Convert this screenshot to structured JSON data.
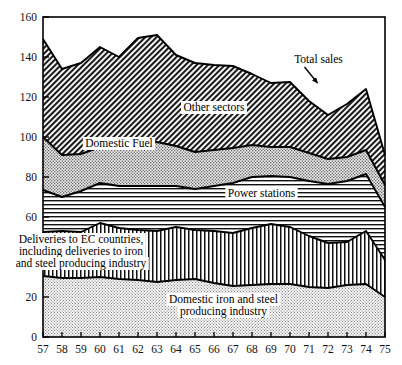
{
  "chart_data": {
    "type": "area",
    "stacked": true,
    "title": "",
    "subtitle": "",
    "xlabel": "",
    "ylabel": "",
    "xlim": [
      57,
      75
    ],
    "ylim": [
      0,
      160
    ],
    "ytick_values": [
      0,
      20,
      40,
      60,
      80,
      100,
      120,
      140,
      160
    ],
    "ytick_labels": [
      "0",
      "20",
      "40",
      "60",
      "80",
      "100",
      "120",
      "140",
      "160"
    ],
    "grid": false,
    "legend_position": "inline-labels",
    "x": [
      57,
      58,
      59,
      60,
      61,
      62,
      63,
      64,
      65,
      66,
      67,
      68,
      69,
      70,
      71,
      72,
      73,
      74,
      75
    ],
    "xtick_labels": [
      "57",
      "58",
      "59",
      "60",
      "61",
      "62",
      "63",
      "64",
      "65",
      "66",
      "67",
      "68",
      "69",
      "70",
      "71",
      "72",
      "73",
      "74",
      "75"
    ],
    "series": [
      {
        "name": "Domestic iron and steel producing industry",
        "pattern": "fine-dots",
        "values": [
          30.5,
          29.5,
          29.5,
          30.0,
          29.0,
          28.5,
          27.5,
          28.5,
          29.0,
          27.0,
          25.5,
          26.0,
          26.5,
          26.5,
          25.0,
          24.5,
          26.0,
          26.5,
          20.0
        ]
      },
      {
        "name": "Deliveries to EC countries, including deliveries to iron and steel producing industry",
        "pattern": "vertical-lines",
        "values": [
          22.0,
          23.5,
          23.0,
          27.0,
          25.5,
          25.0,
          25.5,
          26.5,
          24.5,
          26.0,
          26.5,
          28.5,
          30.0,
          28.5,
          25.5,
          22.5,
          21.5,
          26.5,
          18.5
        ]
      },
      {
        "name": "Power stations",
        "pattern": "horizontal-lines",
        "values": [
          21.0,
          17.0,
          20.5,
          20.0,
          21.0,
          22.0,
          22.5,
          20.5,
          20.5,
          22.5,
          25.0,
          25.5,
          24.0,
          25.0,
          27.5,
          29.5,
          30.5,
          28.5,
          26.5
        ]
      },
      {
        "name": "Domestic Fuel",
        "pattern": "coarse-dots",
        "values": [
          26.5,
          21.0,
          18.5,
          18.0,
          19.5,
          21.5,
          22.0,
          20.0,
          18.5,
          18.0,
          17.5,
          16.0,
          14.5,
          15.0,
          14.0,
          12.5,
          12.0,
          12.0,
          11.0
        ]
      },
      {
        "name": "Other sectors",
        "pattern": "diagonal-hatch",
        "values": [
          49.0,
          43.0,
          45.5,
          50.0,
          45.0,
          52.5,
          53.5,
          45.5,
          44.5,
          42.5,
          41.0,
          35.5,
          32.0,
          32.5,
          26.0,
          22.0,
          26.5,
          30.5,
          15.0
        ]
      }
    ],
    "totals": [
      149.0,
      134.0,
      137.0,
      145.0,
      140.0,
      149.5,
      151.0,
      141.0,
      137.0,
      136.0,
      135.5,
      131.5,
      127.0,
      127.5,
      118.0,
      111.0,
      116.5,
      124.0,
      91.0
    ],
    "annotations": [
      {
        "id": "total-sales",
        "text": "Total sales",
        "x_value": 71.5,
        "y_value": 137
      },
      {
        "id": "other-sectors",
        "text": "Other sectors",
        "x_value": 66.0,
        "y_value": 113
      },
      {
        "id": "domestic-fuel",
        "text": "Domestic Fuel",
        "x_value": 61.0,
        "y_value": 95
      },
      {
        "id": "power-stations",
        "text": "Power stations",
        "x_value": 68.5,
        "y_value": 70
      },
      {
        "id": "deliveries-ec-line1",
        "text": "Deliveries to EC countries,",
        "x_value": 59.0,
        "y_value": 47
      },
      {
        "id": "deliveries-ec-line2",
        "text": "including deliveries to iron",
        "x_value": 59.0,
        "y_value": 41
      },
      {
        "id": "deliveries-ec-line3",
        "text": "and steel producing industry",
        "x_value": 59.0,
        "y_value": 35
      },
      {
        "id": "domestic-iron-line1",
        "text": "Domestic iron and steel",
        "x_value": 66.5,
        "y_value": 17
      },
      {
        "id": "domestic-iron-line2",
        "text": "producing industry",
        "x_value": 66.5,
        "y_value": 11
      }
    ]
  },
  "colors": {
    "axis": "#000000",
    "outline": "#000000",
    "background": "#ffffff",
    "band_domestic_iron": "#efefef",
    "band_deliveries_ec": "#ffffff",
    "band_power_stations": "#ffffff",
    "band_domestic_fuel": "#e2e2e2",
    "band_other_sectors": "#d0d0d0"
  }
}
